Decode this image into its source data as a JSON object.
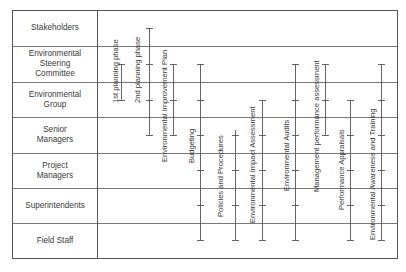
{
  "table": {
    "left": 12,
    "right": 397,
    "top": 10,
    "bottom": 258,
    "label_col_right": 97,
    "line_color": "#555555"
  },
  "rows": [
    {
      "label": "Stakeholders",
      "top": 10,
      "bottom": 46
    },
    {
      "label": "Environmental Steering Committee",
      "lines": [
        "Environmental",
        "Steering",
        "Committee"
      ],
      "top": 46,
      "bottom": 82
    },
    {
      "label": "Environmental Group",
      "lines": [
        "Environmental",
        "Group"
      ],
      "top": 82,
      "bottom": 117
    },
    {
      "label": "Senior Managers",
      "lines": [
        "Senior",
        "Managers"
      ],
      "top": 117,
      "bottom": 153
    },
    {
      "label": "Project Managers",
      "lines": [
        "Project",
        "Managers"
      ],
      "top": 153,
      "bottom": 188
    },
    {
      "label": "Superintendents",
      "top": 188,
      "bottom": 223
    },
    {
      "label": "Field Staff",
      "top": 223,
      "bottom": 258
    }
  ],
  "activities": [
    {
      "label": "1st planning phase",
      "x": 121,
      "y1": 64,
      "y2": 100,
      "label_x": 111,
      "label_bottom": 103
    },
    {
      "label": "2nd planning phase",
      "x": 149,
      "y1": 28,
      "y2": 135,
      "label_x": 133,
      "label_bottom": 103
    },
    {
      "label": "Environmental Improvement Plan",
      "x": 173,
      "y1": 64,
      "y2": 135,
      "label_x": 160,
      "label_bottom": 162
    },
    {
      "label": "Budgeting",
      "x": 200,
      "y1": 64,
      "y2": 240,
      "label_x": 187,
      "label_bottom": 163
    },
    {
      "label": "Policies and Procedures",
      "x": 235,
      "y1": 130,
      "y2": 240,
      "label_x": 216,
      "label_bottom": 217
    },
    {
      "label": "Environmental Impact Assessment",
      "x": 262,
      "y1": 100,
      "y2": 240,
      "label_x": 248,
      "label_bottom": 223
    },
    {
      "label": "Environmental Audits",
      "x": 295,
      "y1": 64,
      "y2": 240,
      "label_x": 282,
      "label_bottom": 191
    },
    {
      "label": "Management performance assessment",
      "x": 325,
      "y1": 64,
      "y2": 135,
      "label_x": 312,
      "label_bottom": 192
    },
    {
      "label": "Performance Appraisals",
      "x": 350,
      "y1": 100,
      "y2": 240,
      "label_x": 337,
      "label_bottom": 210
    },
    {
      "label": "Environmental Awareness and Training",
      "x": 381,
      "y1": 64,
      "y2": 240,
      "label_x": 368,
      "label_bottom": 240
    }
  ],
  "tick_rows": [
    28,
    64,
    100,
    135,
    170,
    205,
    240
  ]
}
